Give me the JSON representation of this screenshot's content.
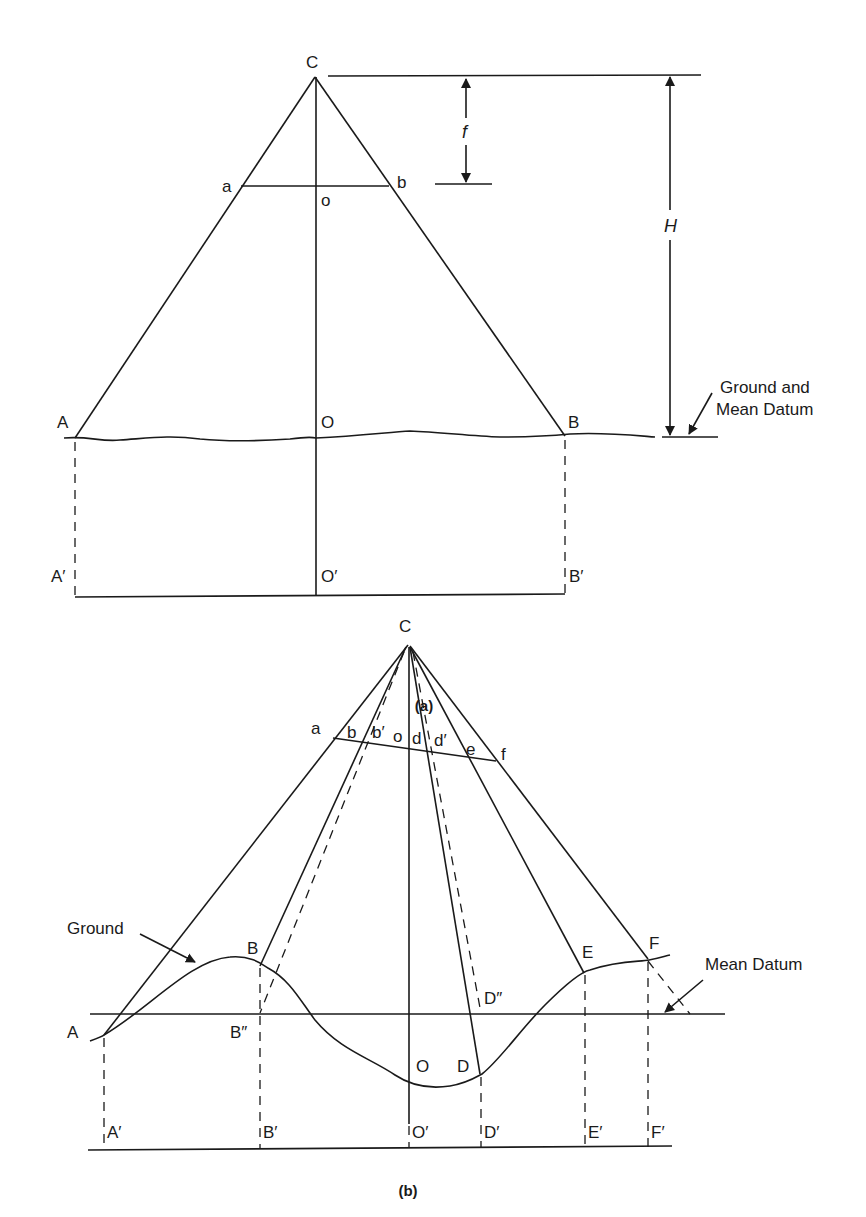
{
  "figure_a": {
    "caption": "(a)",
    "labels": {
      "C": "C",
      "a": "a",
      "b": "b",
      "o": "o",
      "f": "f",
      "H": "H",
      "A": "A",
      "O": "O",
      "B": "B",
      "A_prime": "A′",
      "O_prime": "O′",
      "B_prime": "B′"
    },
    "annotation_line1": "Ground and",
    "annotation_line2": "Mean Datum"
  },
  "figure_b": {
    "caption": "(b)",
    "labels": {
      "C": "C",
      "a": "a",
      "b": "b",
      "b_prime": "b′",
      "o": "o",
      "d": "d",
      "d_prime": "d′",
      "e": "e",
      "f": "f",
      "A": "A",
      "B": "B",
      "B_double_prime": "B″",
      "O": "O",
      "D": "D",
      "D_double_prime": "D″",
      "E": "E",
      "F": "F",
      "A_prime": "A′",
      "B_prime": "B′",
      "O_prime": "O′",
      "D_prime": "D′",
      "E_prime": "E′",
      "F_prime": "F′"
    },
    "ground_label": "Ground",
    "mean_datum_label": "Mean Datum"
  }
}
